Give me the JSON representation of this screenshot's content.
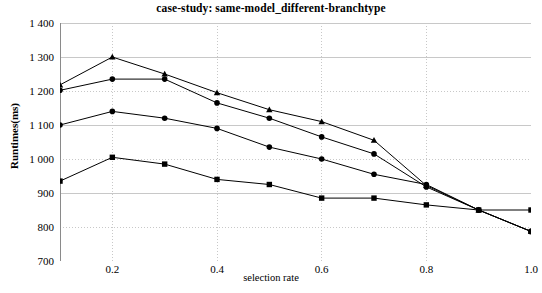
{
  "chart_data": {
    "type": "line",
    "title": "case-study: same-model_different-branchtype",
    "xlabel": "selection rate",
    "ylabel": "Runtimes(ms)",
    "xlim": [
      0.1,
      1.0
    ],
    "ylim": [
      700,
      1400
    ],
    "xticks": [
      "0.2",
      "0.4",
      "0.6",
      "0.8",
      "1.0"
    ],
    "xtick_values": [
      0.2,
      0.4,
      0.6,
      0.8,
      1.0
    ],
    "yticks": [
      "700",
      "800",
      "900",
      "1 000",
      "1 100",
      "1 200",
      "1 300",
      "1 400"
    ],
    "ytick_values": [
      700,
      800,
      900,
      1000,
      1100,
      1200,
      1300,
      1400
    ],
    "grid": true,
    "legend": "none",
    "line_color": "#000000",
    "grid_color": "#c8c8c8",
    "x": [
      0.1,
      0.2,
      0.3,
      0.4,
      0.5,
      0.6,
      0.7,
      0.8,
      0.9,
      1.0
    ],
    "series": [
      {
        "name": "series-1",
        "marker": "triangle",
        "values": [
          1218,
          1300,
          1250,
          1195,
          1145,
          1110,
          1055,
          922,
          850,
          787
        ]
      },
      {
        "name": "series-2",
        "marker": "circle",
        "values": [
          1202,
          1235,
          1235,
          1165,
          1120,
          1065,
          1015,
          918,
          850,
          787
        ]
      },
      {
        "name": "series-3",
        "marker": "circle",
        "values": [
          1100,
          1140,
          1120,
          1090,
          1035,
          1000,
          955,
          925,
          850,
          787
        ]
      },
      {
        "name": "series-4",
        "marker": "square",
        "values": [
          935,
          1005,
          985,
          940,
          925,
          885,
          885,
          865,
          850,
          850
        ]
      }
    ]
  }
}
